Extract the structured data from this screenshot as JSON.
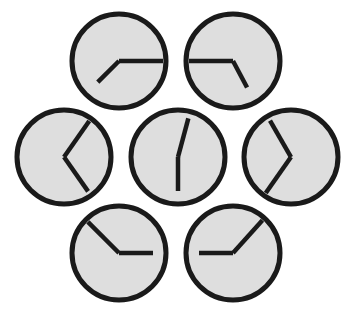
{
  "scene": {
    "title": "seven-analog-clocks",
    "width": 343,
    "height": 310,
    "background_color": "#ffffff",
    "description": "Seven analog clock faces arranged in a hexagonal rosette with one clock in the center"
  },
  "style": {
    "face_fill": "#dedede",
    "face_stroke": "#1a1a1a",
    "face_stroke_width": 5,
    "hand_color": "#1a1a1a",
    "hand_width": 4.5,
    "radius": 47
  },
  "clocks": [
    {
      "id": "clock-top-left",
      "position_label": "top-left",
      "cx": 119,
      "cy": 61,
      "r": 47,
      "hands": [
        {
          "name": "minute-hand",
          "angle_deg": 90,
          "length": 44
        },
        {
          "name": "hour-hand",
          "angle_deg": 225,
          "length": 30
        }
      ],
      "reading": "3:37"
    },
    {
      "id": "clock-top-right",
      "position_label": "top-right",
      "cx": 233,
      "cy": 61,
      "r": 47,
      "hands": [
        {
          "name": "minute-hand",
          "angle_deg": 270,
          "length": 44
        },
        {
          "name": "hour-hand",
          "angle_deg": 152,
          "length": 30
        }
      ],
      "reading": "4:45"
    },
    {
      "id": "clock-left",
      "position_label": "left",
      "cx": 64,
      "cy": 157,
      "r": 47,
      "hands": [
        {
          "name": "minute-hand",
          "angle_deg": 35,
          "length": 44
        },
        {
          "name": "hour-hand",
          "angle_deg": 145,
          "length": 42
        }
      ],
      "reading": "1:06"
    },
    {
      "id": "clock-center",
      "position_label": "center",
      "cx": 178,
      "cy": 157,
      "r": 47,
      "hands": [
        {
          "name": "minute-hand",
          "angle_deg": 15,
          "length": 40
        },
        {
          "name": "hour-hand",
          "angle_deg": 180,
          "length": 34
        }
      ],
      "reading": "6:02"
    },
    {
      "id": "clock-right",
      "position_label": "right",
      "cx": 291,
      "cy": 157,
      "r": 47,
      "hands": [
        {
          "name": "minute-hand",
          "angle_deg": 330,
          "length": 42
        },
        {
          "name": "hour-hand",
          "angle_deg": 215,
          "length": 44
        }
      ],
      "reading": "11:00"
    },
    {
      "id": "clock-bottom-left",
      "position_label": "bottom-left",
      "cx": 119,
      "cy": 253,
      "r": 47,
      "hands": [
        {
          "name": "minute-hand",
          "angle_deg": 315,
          "length": 44
        },
        {
          "name": "hour-hand",
          "angle_deg": 90,
          "length": 34
        }
      ],
      "reading": "10:15"
    },
    {
      "id": "clock-bottom-right",
      "position_label": "bottom-right",
      "cx": 233,
      "cy": 253,
      "r": 47,
      "hands": [
        {
          "name": "minute-hand",
          "angle_deg": 42,
          "length": 44
        },
        {
          "name": "hour-hand",
          "angle_deg": 270,
          "length": 34
        }
      ],
      "reading": "9:08"
    }
  ]
}
